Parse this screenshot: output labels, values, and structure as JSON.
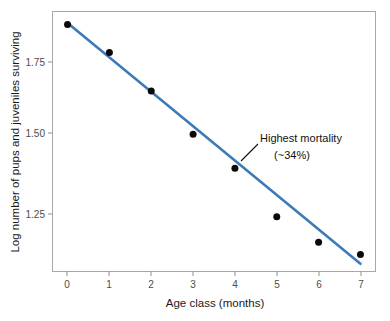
{
  "chart_data": {
    "type": "scatter",
    "title": "",
    "xlabel": "Age class (months)",
    "ylabel": "Log number of pups and juveniles surviving",
    "x": [
      0,
      1,
      2,
      3,
      4,
      5,
      6,
      7
    ],
    "values": [
      1.87,
      1.78,
      1.655,
      1.515,
      1.405,
      1.248,
      1.165,
      1.125
    ],
    "series": [
      {
        "name": "Pups and juveniles surviving",
        "values": [
          1.87,
          1.78,
          1.655,
          1.515,
          1.405,
          1.248,
          1.165,
          1.125
        ]
      },
      {
        "name": "Fitted regression line",
        "type": "line",
        "x": [
          0,
          7
        ],
        "values": [
          1.875,
          1.095
        ]
      }
    ],
    "xlim": [
      -0.36,
      7.36
    ],
    "ylim": [
      1.0703,
      1.9124
    ],
    "xticks": [
      0,
      1,
      2,
      3,
      4,
      5,
      6,
      7
    ],
    "xtick_labels": [
      "0",
      "1",
      "2",
      "3",
      "4",
      "5",
      "6",
      "7"
    ],
    "yticks": [
      1.25,
      1.5,
      1.75
    ],
    "ytick_labels": [
      "1.25",
      "1.50",
      "1.75"
    ],
    "grid": false,
    "legend": null,
    "legend_position": "none",
    "annotations": [
      {
        "line1": "Highest mortality",
        "line2": "(~34%)",
        "points_to_x": 4,
        "points_to_y": 1.405
      }
    ],
    "colors": {
      "line": "#3d7ab8",
      "points": "#0a0a0a",
      "frame": "#a8a8a8",
      "tick_label": "#4c4c4c",
      "axis_title": "#1a1a1a",
      "annotation": "#111111",
      "background": "#ffffff"
    }
  }
}
